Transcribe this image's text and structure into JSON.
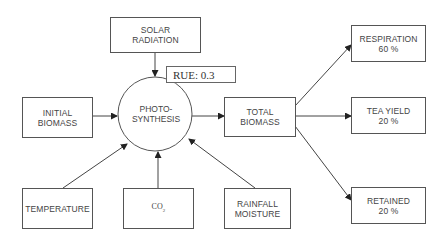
{
  "diagram": {
    "title": "",
    "nodes": {
      "solar_radiation": {
        "line1": "SOLAR",
        "line2": "RADIATION"
      },
      "rue": {
        "label": "RUE: 0.3"
      },
      "initial_biomass": {
        "line1": "INITIAL",
        "line2": "BIOMASS"
      },
      "photosynthesis": {
        "line1": "PHOTO-",
        "line2": "SYNTHESIS"
      },
      "total_biomass": {
        "line1": "TOTAL",
        "line2": "BIOMASS"
      },
      "respiration": {
        "line1": "RESPIRATION",
        "line2": "60 %"
      },
      "tea_yield": {
        "line1": "TEA YIELD",
        "line2": "20 %"
      },
      "retained": {
        "line1": "RETAINED",
        "line2": "20 %"
      },
      "temperature": {
        "label": "TEMPERATURE"
      },
      "co2": {
        "main": "CO",
        "sub": "2"
      },
      "rainfall_moisture": {
        "line1": "RAINFALL",
        "line2": "MOISTURE"
      }
    },
    "edges": [
      {
        "from": "solar_radiation",
        "to": "photosynthesis"
      },
      {
        "from": "initial_biomass",
        "to": "photosynthesis"
      },
      {
        "from": "temperature",
        "to": "photosynthesis"
      },
      {
        "from": "co2",
        "to": "photosynthesis"
      },
      {
        "from": "rainfall_moisture",
        "to": "photosynthesis"
      },
      {
        "from": "photosynthesis",
        "to": "total_biomass"
      },
      {
        "from": "total_biomass",
        "to": "respiration"
      },
      {
        "from": "total_biomass",
        "to": "tea_yield"
      },
      {
        "from": "total_biomass",
        "to": "retained"
      }
    ],
    "colors": {
      "stroke": "#555555",
      "text": "#444444",
      "background": "#ffffff"
    }
  }
}
